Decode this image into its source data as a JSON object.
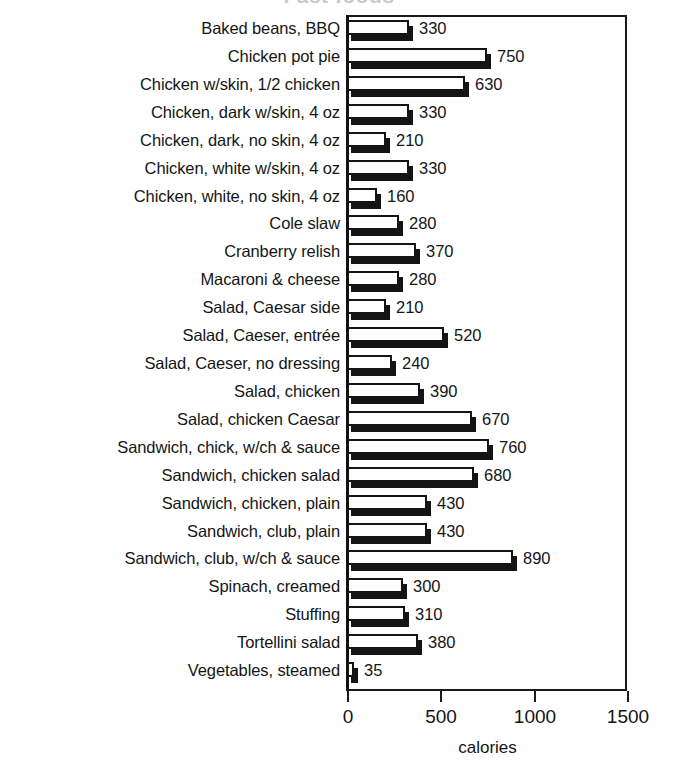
{
  "title": {
    "text": "Fast foods",
    "note": "cropped at top edge"
  },
  "axis": {
    "x_label": "calories",
    "ticks": [
      "0",
      "500",
      "1000",
      "1500"
    ],
    "tick_values": [
      0,
      500,
      1000,
      1500
    ],
    "xmin": 0,
    "xmax": 1500
  },
  "chart_data": {
    "type": "bar",
    "orientation": "horizontal",
    "title": "Fast foods",
    "xlabel": "calories",
    "ylabel": "",
    "xlim": [
      0,
      1500
    ],
    "grid": false,
    "legend": "none",
    "tick_labels": [
      "0",
      "500",
      "1000",
      "1500"
    ],
    "categories": [
      "Baked beans, BBQ",
      "Chicken pot pie",
      "Chicken w/skin, 1/2 chicken",
      "Chicken, dark w/skin, 4 oz",
      "Chicken, dark, no skin, 4 oz",
      "Chicken, white w/skin, 4 oz",
      "Chicken, white, no skin, 4 oz",
      "Cole slaw",
      "Cranberry relish",
      "Macaroni & cheese",
      "Salad, Caesar side",
      "Salad, Caeser, entrée",
      "Salad, Caeser, no dressing",
      "Salad, chicken",
      "Salad, chicken Caesar",
      "Sandwich, chick, w/ch & sauce",
      "Sandwich, chicken salad",
      "Sandwich, chicken, plain",
      "Sandwich, club, plain",
      "Sandwich, club, w/ch & sauce",
      "Spinach, creamed",
      "Stuffing",
      "Tortellini salad",
      "Vegetables, steamed"
    ],
    "values": [
      330,
      750,
      630,
      330,
      210,
      330,
      160,
      280,
      370,
      280,
      210,
      520,
      240,
      390,
      670,
      760,
      680,
      430,
      430,
      890,
      300,
      310,
      380,
      35
    ],
    "value_labels": [
      "330",
      "750",
      "630",
      "330",
      "210",
      "330",
      "160",
      "280",
      "370",
      "280",
      "210",
      "520",
      "240",
      "390",
      "670",
      "760",
      "680",
      "430",
      "430",
      "890",
      "300",
      "310",
      "380",
      "35"
    ]
  },
  "style": {
    "bar_face_color": "#ffffff",
    "bar_outline_color": "#141414",
    "bar_shadow_color": "#141414",
    "text_color": "#151515",
    "background": "#ffffff"
  }
}
